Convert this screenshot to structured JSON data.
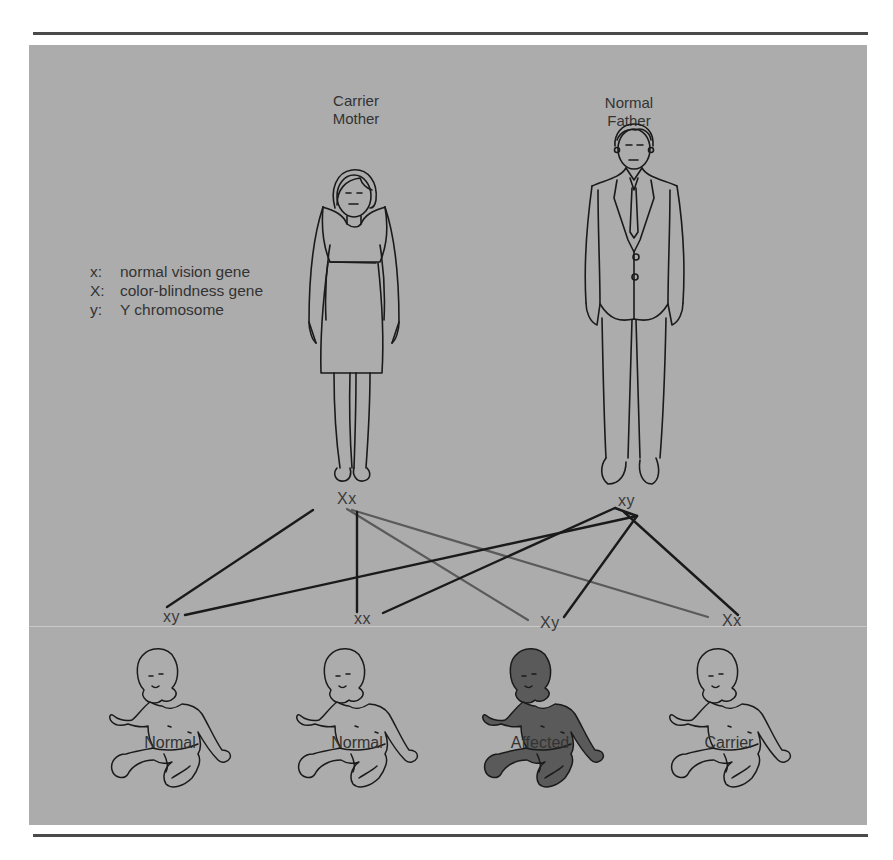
{
  "parents": {
    "mother": {
      "label_line1": "Carrier",
      "label_line2": "Mother",
      "genotype": "Xx"
    },
    "father": {
      "label_line1": "Normal",
      "label_line2": "Father",
      "genotype": "xy"
    }
  },
  "legend": [
    {
      "key": "x:",
      "text": "normal vision gene"
    },
    {
      "key": "X:",
      "text": "color-blindness gene"
    },
    {
      "key": "y:",
      "text": "Y chromosome"
    }
  ],
  "children": [
    {
      "genotype": "xy",
      "label": "Normal",
      "affected": false
    },
    {
      "genotype": "xx",
      "label": "Normal",
      "affected": false
    },
    {
      "genotype": "Xy",
      "label": "Affected",
      "affected": true
    },
    {
      "genotype": "Xx",
      "label": "Carrier",
      "affected": false
    }
  ],
  "colors": {
    "panel": "#acacac",
    "line_dark": "#1e1e1e",
    "line_gray": "#5e5e5e",
    "affected_fill": "#5a5a5a",
    "text": "#333333"
  }
}
